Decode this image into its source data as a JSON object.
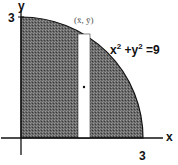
{
  "figure": {
    "axes": {
      "x_label": "x",
      "y_label": "y",
      "x_tick": "3",
      "y_tick": "3"
    },
    "curve": {
      "equation_lhs_x": "x",
      "equation_exp1": "2",
      "equation_plus": " +y",
      "equation_exp2": "2",
      "equation_rhs": " =9",
      "radius": 3
    },
    "strip": {
      "centroid_label": "(x̄, ȳ)"
    },
    "colors": {
      "fill": "#5a5a5a",
      "fill_light": "#8a8a8a",
      "axis": "#111111",
      "strip": "#ffffff",
      "label": "#111111"
    }
  }
}
